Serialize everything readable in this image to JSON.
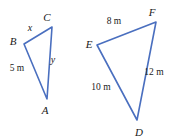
{
  "figure": {
    "stroke_color": "#4A6FBF",
    "stroke_width": 1.6,
    "text_color": "#1a1a1a",
    "background_color": "#ffffff",
    "width": 178,
    "height": 140
  },
  "triangles": [
    {
      "name": "triangle-abc",
      "vertices": [
        {
          "id": "B",
          "label": "B",
          "x": 24,
          "y": 44,
          "label_x": 13,
          "label_y": 41
        },
        {
          "id": "C",
          "label": "C",
          "x": 52,
          "y": 27,
          "label_x": 47,
          "label_y": 17
        },
        {
          "id": "A",
          "label": "A",
          "x": 47,
          "y": 99,
          "label_x": 45,
          "label_y": 110
        }
      ],
      "sides": [
        {
          "id": "BC",
          "label": "x",
          "type": "variable",
          "label_x": 30,
          "label_y": 28
        },
        {
          "id": "CA",
          "label": "y",
          "type": "variable",
          "label_x": 53,
          "label_y": 60
        },
        {
          "id": "BA",
          "label": "5 m",
          "type": "measure",
          "label_x": 17,
          "label_y": 69
        }
      ]
    },
    {
      "name": "triangle-def",
      "vertices": [
        {
          "id": "E",
          "label": "E",
          "x": 97,
          "y": 45,
          "label_x": 89,
          "label_y": 44
        },
        {
          "id": "F",
          "label": "F",
          "x": 156,
          "y": 22,
          "label_x": 152,
          "label_y": 12
        },
        {
          "id": "D",
          "label": "D",
          "x": 137,
          "y": 120,
          "label_x": 139,
          "label_y": 132
        }
      ],
      "sides": [
        {
          "id": "EF",
          "label": "8 m",
          "type": "measure",
          "label_x": 114,
          "label_y": 22
        },
        {
          "id": "FD",
          "label": "12 m",
          "type": "measure",
          "label_x": 154,
          "label_y": 73
        },
        {
          "id": "ED",
          "label": "10 m",
          "type": "measure",
          "label_x": 101,
          "label_y": 88
        }
      ]
    }
  ]
}
